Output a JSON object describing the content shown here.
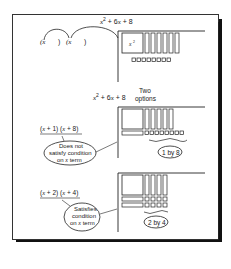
{
  "figure": {
    "top": {
      "expression": "x² + 6x + 8",
      "factor_template_left": "(x    )",
      "factor_template_right": "(x    )",
      "square_label": "x²",
      "x_bars": 6,
      "unit_tiles": 8
    },
    "middle": {
      "expression": "x² + 6x + 8",
      "options_line1": "Two",
      "options_line2": "options"
    },
    "option1": {
      "factors": "(x + 1)  (x + 8)",
      "note_line1": "Does not",
      "note_line2": "satisfy condition",
      "note_line3": "on x term",
      "dims": "1 by 8",
      "x_bars": 5,
      "unit_tiles": 8
    },
    "option2": {
      "factors": "(x + 2)  (x + 4)",
      "note_line1": "Satisfies",
      "note_line2": "condition",
      "note_line3": "on x term",
      "dims": "2 by 4",
      "x_bars": 4,
      "unit_tiles": 8
    }
  },
  "colors": {
    "ink": "#222222",
    "border": "#333333",
    "shadow": "#111111",
    "background": "#ffffff"
  }
}
